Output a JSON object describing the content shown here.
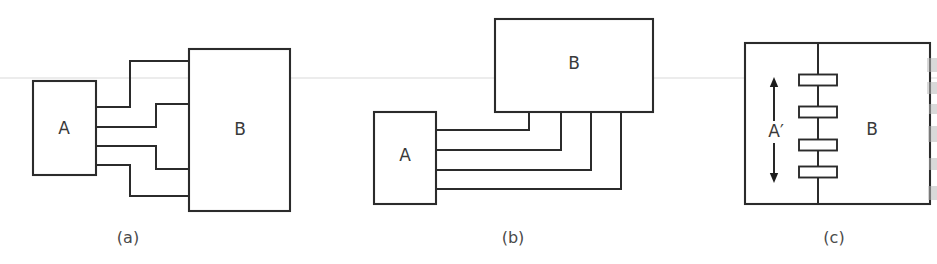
{
  "figure": {
    "width": 937,
    "height": 264,
    "background": "#ffffff",
    "ink_color": "#2b2b2b",
    "label_color": "#3a3a3a",
    "caption_color": "#4a4a4a",
    "artifact_color": "#d9d9d9",
    "smudge_color": "#b9b9b9"
  },
  "panels": [
    {
      "id": "a",
      "caption": "(a)",
      "caption_x": 128,
      "caption_y": 238,
      "description": "Block A at left joined to taller block B at right by four jogged interconnect wires",
      "blocks": [
        {
          "name": "block-a",
          "label": "A",
          "x": 33,
          "y": 81,
          "w": 63,
          "h": 94,
          "label_x": 64,
          "label_y": 129
        },
        {
          "name": "block-b",
          "label": "B",
          "x": 189,
          "y": 49,
          "w": 101,
          "h": 162,
          "label_x": 240,
          "label_y": 130
        }
      ],
      "wires": [
        {
          "name": "wire-1",
          "points": "96,107 130,107 130,61 189,61"
        },
        {
          "name": "wire-2",
          "points": "96,127 156,127 156,104 189,104"
        },
        {
          "name": "wire-3",
          "points": "96,146 156,146 156,169 189,169"
        },
        {
          "name": "wire-4",
          "points": "96,165 130,165 130,196 189,196"
        }
      ]
    },
    {
      "id": "b",
      "caption": "(b)",
      "caption_x": 513,
      "caption_y": 238,
      "description": "Wide block B above, smaller block A at lower left, four nested wires rise from A to the underside of B",
      "blocks": [
        {
          "name": "block-b",
          "label": "B",
          "x": 495,
          "y": 19,
          "w": 158,
          "h": 93,
          "label_x": 574,
          "label_y": 64
        },
        {
          "name": "block-a",
          "label": "A",
          "x": 374,
          "y": 112,
          "w": 62,
          "h": 92,
          "label_x": 405,
          "label_y": 156
        }
      ],
      "wires": [
        {
          "name": "wire-1",
          "points": "436,130 529,130 529,112"
        },
        {
          "name": "wire-2",
          "points": "436,150 561,150 561,112"
        },
        {
          "name": "wire-3",
          "points": "436,170 591,170 591,112"
        },
        {
          "name": "wire-4",
          "points": "436,189 621,189 621,112"
        }
      ]
    },
    {
      "id": "c",
      "caption": "(c)",
      "caption_x": 834,
      "caption_y": 238,
      "description": "Single merged block split by a vertical boundary: region A-prime at left with a double headed vertical arrow, region B at right, four contact pads straddling the boundary",
      "outline": {
        "name": "merged-block",
        "x": 745,
        "y": 43,
        "w": 185,
        "h": 161
      },
      "divider_x": 818,
      "blocks": [
        {
          "name": "region-a-prime",
          "label": "A′",
          "label_x": 776,
          "label_y": 132
        },
        {
          "name": "region-b",
          "label": "B",
          "label_x": 872,
          "label_y": 130
        }
      ],
      "arrow": {
        "name": "extent-arrow",
        "x": 774,
        "y_top": 77,
        "y_bottom": 183,
        "gap_top": 121,
        "gap_bottom": 143
      },
      "pads": [
        {
          "name": "contact-pad-1",
          "cx": 818,
          "cy": 80,
          "w": 38,
          "h": 11
        },
        {
          "name": "contact-pad-2",
          "cx": 818,
          "cy": 112,
          "w": 38,
          "h": 11
        },
        {
          "name": "contact-pad-3",
          "cx": 818,
          "cy": 145,
          "w": 38,
          "h": 11
        },
        {
          "name": "contact-pad-4",
          "cx": 818,
          "cy": 172,
          "w": 38,
          "h": 11
        }
      ]
    }
  ],
  "artifacts": {
    "scan_line": {
      "name": "scan-line",
      "y": 78,
      "x_start": 0,
      "x_end": 937
    },
    "edge_smudges": [
      {
        "name": "edge-smudge",
        "x": 927,
        "y": 58,
        "w": 10,
        "h": 14
      },
      {
        "name": "edge-smudge",
        "x": 927,
        "y": 82,
        "w": 10,
        "h": 12
      },
      {
        "name": "edge-smudge",
        "x": 929,
        "y": 104,
        "w": 8,
        "h": 10
      },
      {
        "name": "edge-smudge",
        "x": 928,
        "y": 126,
        "w": 9,
        "h": 16
      },
      {
        "name": "edge-smudge",
        "x": 929,
        "y": 158,
        "w": 8,
        "h": 12
      },
      {
        "name": "edge-smudge",
        "x": 928,
        "y": 186,
        "w": 9,
        "h": 14
      }
    ]
  }
}
